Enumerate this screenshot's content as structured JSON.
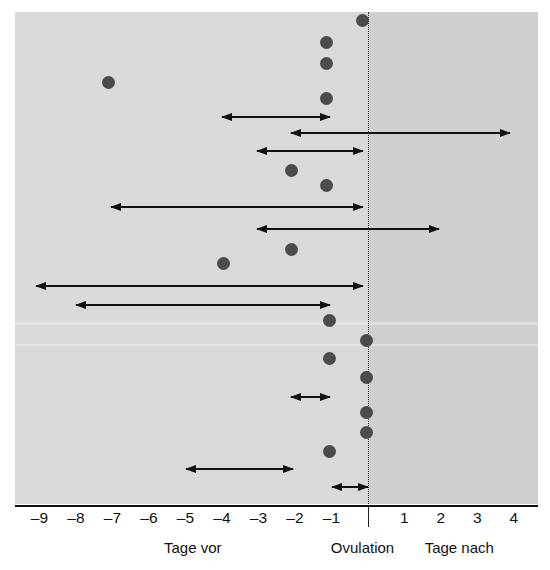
{
  "chart_data": {
    "type": "scatter",
    "title": "",
    "xlabel": "",
    "ylabel": "",
    "xlim": [
      -9.6,
      4.6
    ],
    "grid": false,
    "legend": null,
    "reference_line": {
      "label": "Ovulation",
      "x": 0,
      "style": "dotted"
    },
    "axis": {
      "tick_values": [
        -9,
        -8,
        -7,
        -6,
        -5,
        -4,
        -3,
        -2,
        -1,
        1,
        2,
        3,
        4
      ],
      "tick_labels": [
        "–9",
        "–8",
        "–7",
        "–6",
        "–5",
        "–4",
        "–3",
        "–2",
        "–1",
        "1",
        "2",
        "3",
        "4"
      ]
    },
    "captions": [
      {
        "text": "Tage vor",
        "x": -4.8
      },
      {
        "text": "Ovulation",
        "x": -0.15
      },
      {
        "text": "Tage nach",
        "x": 2.5
      }
    ],
    "series": [
      {
        "name": "Einzelner Geschlechtsverkehr (Punkt)",
        "marker": "dot",
        "color": "#4b4b4b",
        "points": [
          {
            "row": 1,
            "x": -0.15
          },
          {
            "row": 2,
            "x": -1.15
          },
          {
            "row": 3,
            "x": -1.15
          },
          {
            "row": 4,
            "x": -7.1
          },
          {
            "row": 5,
            "x": -1.15
          },
          {
            "row": 9,
            "x": -2.1
          },
          {
            "row": 10,
            "x": -1.15
          },
          {
            "row": 13,
            "x": -2.1
          },
          {
            "row": 14,
            "x": -3.95
          },
          {
            "row": 17,
            "x": -1.05
          },
          {
            "row": 18,
            "x": -0.05
          },
          {
            "row": 19,
            "x": -1.05
          },
          {
            "row": 20,
            "x": -0.05
          },
          {
            "row": 22,
            "x": -0.05
          },
          {
            "row": 23,
            "x": -0.05
          },
          {
            "row": 24,
            "x": -1.05
          }
        ]
      },
      {
        "name": "Zeitraum mit Geschlechtsverkehr (Doppelpfeil)",
        "marker": "double-arrow",
        "color": "#101010",
        "intervals": [
          {
            "row": 6,
            "x_start": -4.0,
            "x_end": -1.05
          },
          {
            "row": 7,
            "x_start": -2.1,
            "x_end": 3.9
          },
          {
            "row": 8,
            "x_start": -3.05,
            "x_end": -0.15
          },
          {
            "row": 11,
            "x_start": -7.05,
            "x_end": -0.15
          },
          {
            "row": 12,
            "x_start": -3.05,
            "x_end": 1.95
          },
          {
            "row": 15,
            "x_start": -9.1,
            "x_end": -0.15
          },
          {
            "row": 16,
            "x_start": -8.0,
            "x_end": -1.05
          },
          {
            "row": 21,
            "x_start": -2.1,
            "x_end": -1.05
          },
          {
            "row": 25,
            "x_start": -5.0,
            "x_end": -2.05
          },
          {
            "row": 26,
            "x_start": -1.0,
            "x_end": 0.0
          }
        ]
      }
    ],
    "row_y_pixels": {
      "1": 20,
      "2": 42,
      "3": 63,
      "4": 82,
      "5": 98,
      "6": 117,
      "7": 133,
      "8": 151,
      "9": 170,
      "10": 185,
      "11": 207,
      "12": 229,
      "13": 249,
      "14": 263,
      "15": 286,
      "16": 305,
      "17": 320,
      "18": 340,
      "19": 358,
      "20": 377,
      "21": 397,
      "22": 412,
      "23": 432,
      "24": 451,
      "25": 469,
      "26": 487
    },
    "colors": {
      "background_before": "#d9d9d9",
      "background_after": "#cfcfcf",
      "dot": "#4b4b4b",
      "arrow": "#101010",
      "axis": "#111111"
    }
  }
}
